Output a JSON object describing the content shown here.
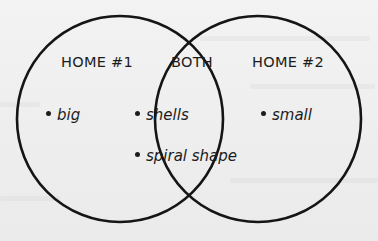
{
  "diagram": {
    "type": "venn",
    "colors": {
      "background": "#ececec",
      "stroke": "#151515",
      "text": "#1c1c1c"
    },
    "sets": [
      {
        "id": "left",
        "label": "HOME #1",
        "items": [
          "big"
        ]
      },
      {
        "id": "overlap",
        "label": "BOTH",
        "items": [
          "shells",
          "spiral shape"
        ]
      },
      {
        "id": "right",
        "label": "HOME #2",
        "items": [
          "small"
        ]
      }
    ],
    "bullet_glyph": "•"
  }
}
